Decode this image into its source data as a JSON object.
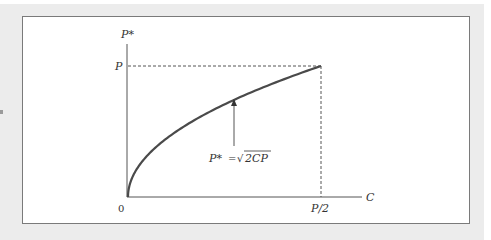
{
  "diagram": {
    "y_axis_label": "P*",
    "x_axis_label": "C",
    "y_tick_label": "P",
    "x_tick_label": "P/2",
    "origin_label": "0",
    "formula": {
      "lhs": "P*",
      "eq": "=",
      "rhs": "2CP",
      "radical": "√"
    },
    "colors": {
      "curve": "#4a4a4a",
      "axis": "#555555",
      "dashed": "#555555",
      "background": "#ececec"
    }
  },
  "chart_data": {
    "type": "line",
    "title": "",
    "xlabel": "C",
    "ylabel": "P*",
    "series": [
      {
        "name": "P* = sqrt(2CP)",
        "function": "sqrt(2*C*P)",
        "x_domain": [
          "0",
          "P/2"
        ],
        "y_range": [
          "0",
          "P"
        ]
      }
    ],
    "x_ticks": [
      "0",
      "P/2"
    ],
    "y_ticks": [
      "P"
    ],
    "reference_lines": [
      {
        "type": "horizontal-dashed",
        "at": "P",
        "from": "0",
        "to": "P/2"
      },
      {
        "type": "vertical-dashed",
        "at": "P/2",
        "from": "0",
        "to": "P"
      }
    ],
    "annotation": {
      "text": "P* = √2CP",
      "arrow": true
    },
    "grid": false
  }
}
